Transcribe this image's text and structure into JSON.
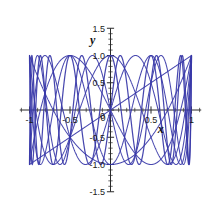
{
  "chart_data": {
    "type": "line",
    "title": "",
    "subtitle": "",
    "xlabel": "x",
    "ylabel": "y",
    "xlim": [
      -1.12,
      1.12
    ],
    "ylim": [
      -1.5,
      1.5
    ],
    "grid": false,
    "legend": false,
    "legend_position": "none",
    "x_ticks_major": [
      -1,
      -0.5,
      0,
      0.5,
      1
    ],
    "x_tick_labels": [
      "-1",
      "-0.5",
      "0",
      "0.5",
      "1"
    ],
    "y_ticks_major": [
      -1.5,
      -1.0,
      -0.5,
      0,
      0.5,
      1.0,
      1.5
    ],
    "y_tick_labels": [
      "-1.5",
      "-1.0",
      "-0.5",
      "0",
      "0.5",
      "1.0",
      "1.5"
    ],
    "x_minor_tick_step": 0.1,
    "y_minor_tick_step": 0.1,
    "series_color": "#3838a8",
    "series": [
      {
        "name": "T1",
        "degree": 1,
        "domain": [
          -1,
          1
        ],
        "range": [
          -1,
          1
        ]
      },
      {
        "name": "T2",
        "degree": 2,
        "domain": [
          -1,
          1
        ],
        "range": [
          -1,
          1
        ]
      },
      {
        "name": "T3",
        "degree": 3,
        "domain": [
          -1,
          1
        ],
        "range": [
          -1,
          1
        ]
      },
      {
        "name": "T4",
        "degree": 4,
        "domain": [
          -1,
          1
        ],
        "range": [
          -1,
          1
        ]
      },
      {
        "name": "T5",
        "degree": 5,
        "domain": [
          -1,
          1
        ],
        "range": [
          -1,
          1
        ]
      },
      {
        "name": "T6",
        "degree": 6,
        "domain": [
          -1,
          1
        ],
        "range": [
          -1,
          1
        ]
      },
      {
        "name": "T7",
        "degree": 7,
        "domain": [
          -1,
          1
        ],
        "range": [
          -1,
          1
        ]
      },
      {
        "name": "T12",
        "degree": 12,
        "domain": [
          -1,
          1
        ],
        "range": [
          -1,
          1
        ]
      },
      {
        "name": "T13",
        "degree": 13,
        "domain": [
          -1,
          1
        ],
        "range": [
          -1,
          1
        ]
      }
    ],
    "annotations": []
  },
  "axis": {
    "x_name": "x",
    "y_name": "y"
  },
  "ticks": {
    "x": [
      {
        "value": -1,
        "label": "-1"
      },
      {
        "value": -0.5,
        "label": "-0.5"
      },
      {
        "value": 0,
        "label": "0"
      },
      {
        "value": 0.5,
        "label": "0.5"
      },
      {
        "value": 1,
        "label": "1"
      }
    ],
    "y": [
      {
        "value": 1.5,
        "label": "1.5"
      },
      {
        "value": 1.0,
        "label": "1.0"
      },
      {
        "value": 0.5,
        "label": "0.5"
      },
      {
        "value": 0,
        "label": "0"
      },
      {
        "value": -0.5,
        "label": "-0.5"
      },
      {
        "value": -1.0,
        "label": "-1.0"
      },
      {
        "value": -1.5,
        "label": "-1.5"
      }
    ]
  },
  "style": {
    "background": "#ffffff",
    "curve_color": "#3838a8",
    "axis_color": "#2a2a2a",
    "text_color": "#1a1a1a"
  }
}
